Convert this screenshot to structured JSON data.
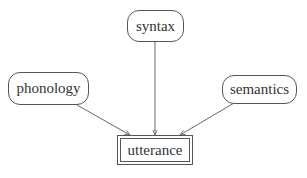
{
  "diagram": {
    "type": "directed-graph",
    "nodes": [
      {
        "id": "syntax",
        "label": "syntax",
        "shape": "rounded-rect"
      },
      {
        "id": "phonology",
        "label": "phonology",
        "shape": "rounded-rect"
      },
      {
        "id": "semantics",
        "label": "semantics",
        "shape": "rounded-rect"
      },
      {
        "id": "utterance",
        "label": "utterance",
        "shape": "double-rect"
      }
    ],
    "edges": [
      {
        "from": "syntax",
        "to": "utterance"
      },
      {
        "from": "phonology",
        "to": "utterance"
      },
      {
        "from": "semantics",
        "to": "utterance"
      }
    ],
    "colors": {
      "stroke": "#555555",
      "text": "#333333",
      "background": "#ffffff"
    }
  }
}
